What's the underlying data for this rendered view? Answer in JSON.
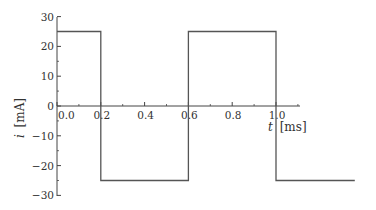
{
  "chart_data": {
    "type": "line",
    "title": "",
    "xlabel": "t [ms]",
    "ylabel": "i [mA]",
    "xlabel_var": "t",
    "xlabel_unit": "[ms]",
    "ylabel_var": "i",
    "ylabel_unit": "[mA]",
    "xlim": [
      0,
      1.36
    ],
    "ylim": [
      -30,
      30
    ],
    "grid": false,
    "legend": null,
    "x_ticks": [
      "0.0",
      "0.2",
      "0.4",
      "0.6",
      "0.8",
      "1.0"
    ],
    "y_ticks": [
      "30",
      "20",
      "10",
      "0",
      "−10",
      "−20",
      "−30"
    ],
    "series": [
      {
        "name": "square wave current",
        "color": "#555555",
        "x": [
          0.0,
          0.2,
          0.2,
          0.6,
          0.6,
          1.0,
          1.0,
          1.36
        ],
        "y": [
          25,
          25,
          -25,
          -25,
          25,
          25,
          -25,
          -25
        ]
      }
    ]
  }
}
